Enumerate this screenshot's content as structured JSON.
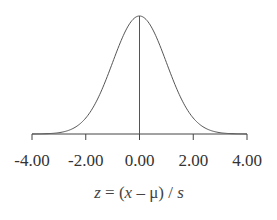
{
  "chart_data": {
    "type": "line",
    "title": "",
    "xlabel": "z = (x - μ) / s",
    "xlabel_parts": {
      "z": "z",
      "eq": " = (",
      "x": "x",
      "mu": " – μ) / ",
      "s": "s"
    },
    "ylabel": "",
    "xlim": [
      -4,
      4
    ],
    "ylim": [
      0,
      0.4
    ],
    "x_ticks": [
      -4,
      -2,
      0,
      2,
      4
    ],
    "x_tick_labels": [
      "-4.00",
      "-2.00",
      "0.00",
      "2.00",
      "4.00"
    ],
    "grid": false,
    "legend": "none",
    "series": [
      {
        "name": "standard normal density",
        "function": "exp(-z^2/2)/sqrt(2*pi)",
        "x": [
          -4,
          -3.5,
          -3,
          -2.5,
          -2,
          -1.5,
          -1,
          -0.5,
          0,
          0.5,
          1,
          1.5,
          2,
          2.5,
          3,
          3.5,
          4
        ],
        "values": [
          0.0001,
          0.0009,
          0.0044,
          0.0175,
          0.054,
          0.1295,
          0.242,
          0.3521,
          0.3989,
          0.3521,
          0.242,
          0.1295,
          0.054,
          0.0175,
          0.0044,
          0.0009,
          0.0001
        ]
      }
    ],
    "reference_lines": [
      {
        "orientation": "vertical",
        "x": 0
      }
    ],
    "colors": {
      "curve": "#555555",
      "axis": "#444444"
    }
  }
}
